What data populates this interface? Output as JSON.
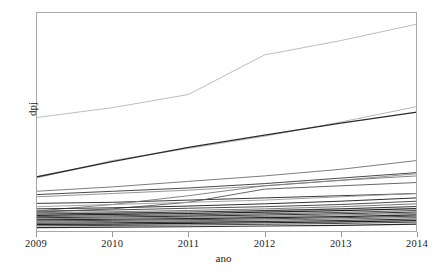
{
  "chart_data": {
    "type": "line",
    "title": "",
    "subtitle": "",
    "xlabel": "ano",
    "ylabel": "dpj",
    "x": [
      2009,
      2010,
      2011,
      2012,
      2013,
      2014
    ],
    "xlim": [
      2009,
      2014
    ],
    "ylim": [
      0,
      100
    ],
    "xtick_labels": [
      "2009",
      "2010",
      "2011",
      "2012",
      "2013",
      "2014"
    ],
    "ytick_labels": [],
    "grid": false,
    "legend": "none",
    "note": "Spaghetti plot: many individual trajectories of dpj by year, no legend and no y-axis tick labels rendered.",
    "series": [
      {
        "name": "serie-01",
        "values": [
          52.0,
          56.5,
          62.5,
          80.5,
          87.0,
          94.5
        ],
        "color": "#b4b4b4",
        "width": 0.9
      },
      {
        "name": "serie-02",
        "values": [
          24.5,
          32.5,
          38.0,
          43.5,
          50.0,
          57.0
        ],
        "color": "#b0b0b0",
        "width": 0.9
      },
      {
        "name": "serie-03",
        "values": [
          25.0,
          32.0,
          38.5,
          44.0,
          49.5,
          54.5
        ],
        "color": "#2a2a2a",
        "width": 1.3
      },
      {
        "name": "serie-04",
        "values": [
          18.5,
          20.5,
          23.0,
          25.5,
          28.5,
          32.5
        ],
        "color": "#6e6e6e",
        "width": 0.9
      },
      {
        "name": "serie-05",
        "values": [
          17.0,
          18.5,
          20.0,
          22.0,
          24.5,
          27.0
        ],
        "color": "#4a4a4a",
        "width": 1.0
      },
      {
        "name": "serie-06",
        "values": [
          16.0,
          17.5,
          19.0,
          21.0,
          23.5,
          26.5
        ],
        "color": "#8a8a8a",
        "width": 0.9
      },
      {
        "name": "serie-07",
        "values": [
          13.0,
          13.5,
          14.5,
          15.5,
          16.5,
          17.5
        ],
        "color": "#3a3a3a",
        "width": 1.0
      },
      {
        "name": "serie-08",
        "values": [
          9.5,
          12.5,
          16.5,
          21.0,
          23.5,
          25.5
        ],
        "color": "#777777",
        "width": 0.9
      },
      {
        "name": "serie-09",
        "values": [
          9.0,
          10.5,
          13.5,
          19.5,
          21.0,
          22.5
        ],
        "color": "#555555",
        "width": 0.9
      },
      {
        "name": "serie-10",
        "values": [
          11.5,
          12.5,
          13.5,
          14.5,
          16.0,
          17.5
        ],
        "color": "#9a9a9a",
        "width": 0.9
      },
      {
        "name": "serie-11",
        "values": [
          10.5,
          11.0,
          11.8,
          12.8,
          14.0,
          15.5
        ],
        "color": "#2e2e2e",
        "width": 1.0
      },
      {
        "name": "serie-12",
        "values": [
          9.5,
          10.0,
          10.8,
          11.5,
          12.5,
          14.0
        ],
        "color": "#4e4e4e",
        "width": 1.0
      },
      {
        "name": "serie-13",
        "values": [
          8.8,
          9.2,
          9.8,
          10.5,
          11.5,
          12.8
        ],
        "color": "#6a6a6a",
        "width": 0.9
      },
      {
        "name": "serie-14",
        "values": [
          8.2,
          8.6,
          9.1,
          9.7,
          10.5,
          11.6
        ],
        "color": "#3c3c3c",
        "width": 1.1
      },
      {
        "name": "serie-15",
        "values": [
          7.6,
          8.0,
          8.4,
          9.0,
          9.7,
          10.6
        ],
        "color": "#222222",
        "width": 1.2
      },
      {
        "name": "serie-16",
        "values": [
          7.0,
          7.4,
          7.8,
          8.3,
          8.9,
          9.8
        ],
        "color": "#565656",
        "width": 1.0
      },
      {
        "name": "serie-17",
        "values": [
          6.5,
          6.8,
          7.2,
          7.7,
          8.3,
          9.1
        ],
        "color": "#333333",
        "width": 1.1
      },
      {
        "name": "serie-18",
        "values": [
          6.0,
          6.3,
          6.7,
          7.1,
          7.7,
          8.5
        ],
        "color": "#707070",
        "width": 0.9
      },
      {
        "name": "serie-19",
        "values": [
          5.5,
          5.8,
          6.1,
          6.5,
          7.0,
          7.8
        ],
        "color": "#272727",
        "width": 1.2
      },
      {
        "name": "serie-20",
        "values": [
          5.0,
          5.3,
          5.6,
          6.0,
          6.5,
          7.2
        ],
        "color": "#4a4a4a",
        "width": 1.0
      },
      {
        "name": "serie-21",
        "values": [
          4.5,
          4.8,
          5.1,
          5.4,
          5.9,
          6.6
        ],
        "color": "#606060",
        "width": 0.9
      },
      {
        "name": "serie-22",
        "values": [
          4.0,
          4.2,
          4.5,
          4.8,
          5.2,
          5.9
        ],
        "color": "#303030",
        "width": 1.1
      },
      {
        "name": "serie-23",
        "values": [
          3.4,
          3.6,
          3.9,
          4.2,
          4.6,
          5.2
        ],
        "color": "#1f1f1f",
        "width": 1.2
      },
      {
        "name": "serie-24",
        "values": [
          2.8,
          3.0,
          3.2,
          3.5,
          3.9,
          4.5
        ],
        "color": "#454545",
        "width": 1.0
      },
      {
        "name": "serie-25",
        "values": [
          2.0,
          2.2,
          2.4,
          2.7,
          3.0,
          3.6
        ],
        "color": "#2b2b2b",
        "width": 1.1
      }
    ]
  },
  "style": {
    "frame_color": "#a8a8a8",
    "tick_color": "#9a9a9a",
    "text_color": "#1c1c1c",
    "background": "#ffffff"
  }
}
